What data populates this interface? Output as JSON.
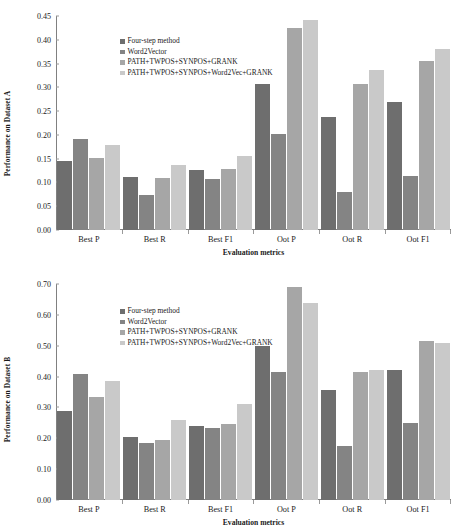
{
  "chart_data": [
    {
      "id": "dataset_a",
      "type": "bar",
      "title": "",
      "xlabel": "Evaluation metrics",
      "ylabel": "Performance on Dataset A",
      "categories": [
        "Best P",
        "Best R",
        "Best F1",
        "Oot P",
        "Oot R",
        "Oot F1"
      ],
      "ylim": [
        0.0,
        0.45
      ],
      "ytick_step": 0.05,
      "ytick_labels": [
        "0.00",
        "0.05",
        "0.10",
        "0.15",
        "0.20",
        "0.25",
        "0.30",
        "0.35",
        "0.40",
        "0.45"
      ],
      "grid": false,
      "legend_position": "top-left",
      "series": [
        {
          "name": "Four-step method",
          "color": "#6e6e6e",
          "values": [
            0.145,
            0.112,
            0.126,
            0.308,
            0.237,
            0.269
          ]
        },
        {
          "name": "Word2Vector",
          "color": "#848484",
          "values": [
            0.192,
            0.074,
            0.107,
            0.201,
            0.079,
            0.114
          ]
        },
        {
          "name": "PATH+TWPOS+SYNPOS+GRANK",
          "color": "#a6a6a6",
          "values": [
            0.152,
            0.11,
            0.128,
            0.424,
            0.306,
            0.356
          ]
        },
        {
          "name": "PATH+TWPOS+SYNPOS+Word2Vec+GRANK",
          "color": "#c9c9c9",
          "values": [
            0.178,
            0.136,
            0.156,
            0.441,
            0.336,
            0.381
          ]
        }
      ]
    },
    {
      "id": "dataset_b",
      "type": "bar",
      "title": "",
      "xlabel": "Evaluation metrics",
      "ylabel": "Performance on Dataset B",
      "categories": [
        "Best P",
        "Best R",
        "Best F1",
        "Oot P",
        "Oot R",
        "Oot F1"
      ],
      "ylim": [
        0.0,
        0.7
      ],
      "ytick_step": 0.1,
      "ytick_labels": [
        "0.00",
        "0.10",
        "0.20",
        "0.30",
        "0.40",
        "0.50",
        "0.60",
        "0.70"
      ],
      "grid": false,
      "legend_position": "top-left",
      "series": [
        {
          "name": "Four-step method",
          "color": "#6e6e6e",
          "values": [
            0.29,
            0.205,
            0.24,
            0.5,
            0.355,
            0.42
          ]
        },
        {
          "name": "Word2Vector",
          "color": "#848484",
          "values": [
            0.41,
            0.185,
            0.235,
            0.415,
            0.175,
            0.25
          ]
        },
        {
          "name": "PATH+TWPOS+SYNPOS+GRANK",
          "color": "#a6a6a6",
          "values": [
            0.335,
            0.195,
            0.245,
            0.69,
            0.415,
            0.515
          ]
        },
        {
          "name": "PATH+TWPOS+SYNPOS+Word2Vec+GRANK",
          "color": "#c9c9c9",
          "values": [
            0.385,
            0.26,
            0.31,
            0.64,
            0.42,
            0.51
          ]
        }
      ]
    }
  ]
}
